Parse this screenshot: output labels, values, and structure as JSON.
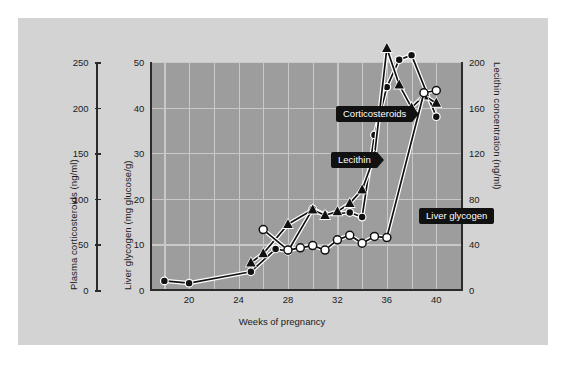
{
  "figure": {
    "background_color": "#ffffff",
    "panel_color": "#d3d3d3",
    "plot_color": "#9d9d9d",
    "grid_color": "#c9c9c9",
    "axis_color": "#2b2b2b",
    "callout_bg": "#111111",
    "callout_fg": "#ffffff"
  },
  "axes": {
    "left_outer": {
      "title": "Plasma corticosteroids (ng/ml)",
      "ticks": [
        0,
        50,
        100,
        150,
        200,
        250
      ],
      "range": [
        0,
        250
      ]
    },
    "left_inner": {
      "title": "Liver glycogen (mg glucose/g)",
      "ticks": [
        0,
        10,
        20,
        30,
        40,
        50
      ],
      "range": [
        0,
        50
      ]
    },
    "right": {
      "title": "Lecithin concentration (ng/ml)",
      "ticks": [
        0,
        40,
        80,
        120,
        160,
        200
      ],
      "range": [
        0,
        200
      ]
    },
    "x": {
      "title": "Weeks of pregnancy",
      "ticks": [
        20,
        24,
        28,
        32,
        36,
        40
      ],
      "range": [
        17,
        42
      ],
      "gridline_step": 2
    }
  },
  "callouts": [
    {
      "label": "Corticosteroids",
      "name": "callout-corticosteroids"
    },
    {
      "label": "Lecithin",
      "name": "callout-lecithin"
    },
    {
      "label": "Liver glycogen",
      "name": "callout-liver-glycogen"
    }
  ],
  "chart_data": {
    "type": "line",
    "title": "",
    "xlabel": "Weeks of pregnancy",
    "ylabel": "Liver glycogen (mg glucose/g)",
    "ylabel_secondary_left": "Plasma corticosteroids (ng/ml)",
    "ylabel_right": "Lecithin concentration (ng/ml)",
    "xlim": [
      17,
      42
    ],
    "ylim": [
      0,
      50
    ],
    "ylim_corticosteroids": [
      0,
      250
    ],
    "ylim_lecithin": [
      0,
      200
    ],
    "grid": true,
    "legend": "inline-callouts",
    "series": [
      {
        "name": "Liver glycogen",
        "marker": "filled-circle",
        "axis": "left-inner",
        "unit": "mg glucose/g",
        "x": [
          18,
          20,
          25,
          27,
          28,
          30,
          31,
          33,
          34,
          35,
          36,
          37,
          38,
          40
        ],
        "values": [
          2.0,
          1.5,
          4.0,
          9.0,
          8.5,
          17.8,
          16.5,
          17.0,
          16.0,
          34.0,
          44.5,
          50.5,
          51.5,
          38.0
        ]
      },
      {
        "name": "Corticosteroids",
        "marker": "filled-triangle",
        "axis": "left-outer",
        "unit": "ng/ml",
        "x": [
          25,
          26,
          28,
          30,
          31,
          32,
          33,
          34,
          35,
          36,
          37,
          38,
          39,
          40
        ],
        "values": [
          30,
          40,
          72,
          88,
          82,
          86,
          95,
          110,
          147,
          265,
          225,
          200,
          213,
          205
        ]
      },
      {
        "name": "Lecithin",
        "marker": "open-circle",
        "axis": "right",
        "unit": "ng/ml",
        "x": [
          26,
          28,
          29,
          30,
          31,
          32,
          33,
          34,
          35,
          36,
          39,
          40
        ],
        "values": [
          53,
          35,
          37,
          39,
          35,
          44,
          48,
          41,
          47,
          46,
          173,
          175
        ]
      }
    ]
  }
}
